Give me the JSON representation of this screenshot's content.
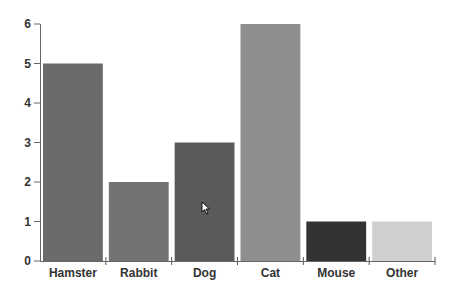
{
  "chart_data": {
    "type": "bar",
    "title": "",
    "xlabel": "",
    "ylabel": "",
    "categories": [
      "Hamster",
      "Rabbit",
      "Dog",
      "Cat",
      "Mouse",
      "Other"
    ],
    "values": [
      5,
      2,
      3,
      6,
      1,
      1
    ],
    "colors": [
      "#6b6b6b",
      "#737373",
      "#5a5a5a",
      "#8e8e8e",
      "#333333",
      "#cfcfcf"
    ],
    "ylim": [
      0,
      6
    ],
    "yticks": [
      0,
      1,
      2,
      3,
      4,
      5,
      6
    ],
    "grid": false,
    "legend": null
  }
}
